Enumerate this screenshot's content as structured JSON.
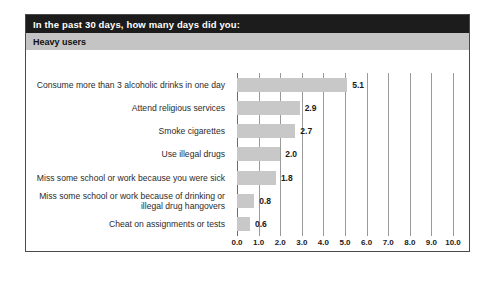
{
  "panel": {
    "title_prefix": "In the past 30 days, how many ",
    "title_emphasis": "days",
    "title_suffix": " did you:",
    "title_full": "In the past 30 days, how many days did you:",
    "subtitle": "Heavy users"
  },
  "colors": {
    "title_band": "#1c1c1c",
    "subtitle_band": "#c4c4c4",
    "bar": "#c8c8c8",
    "gridline": "#9a9a9a",
    "border": "#4a4a4a",
    "text": "#2b2b2b"
  },
  "chart_data": {
    "type": "bar",
    "orientation": "horizontal",
    "title": "In the past 30 days, how many days did you:",
    "subtitle": "Heavy users",
    "xlabel": "",
    "ylabel": "",
    "xlim": [
      0.0,
      10.0
    ],
    "xticks": [
      "0.0",
      "1.0",
      "2.0",
      "3.0",
      "4.0",
      "5.0",
      "6.0",
      "7.0",
      "8.0",
      "9.0",
      "10.0"
    ],
    "xtick_values": [
      0,
      1,
      2,
      3,
      4,
      5,
      6,
      7,
      8,
      9,
      10
    ],
    "grid": true,
    "legend": false,
    "categories": [
      "Consume more than 3 alcoholic drinks in one day",
      "Attend religious services",
      "Smoke cigarettes",
      "Use illegal drugs",
      "Miss some school or work because you were sick",
      "Miss some school or work because of drinking or illegal drug hangovers",
      "Cheat on assignments or tests"
    ],
    "values": [
      5.1,
      2.9,
      2.7,
      2.0,
      1.8,
      0.8,
      0.6
    ],
    "value_labels": [
      "5.1",
      "2.9",
      "2.7",
      "2.0",
      "1.8",
      "0.8",
      "0.6"
    ]
  }
}
